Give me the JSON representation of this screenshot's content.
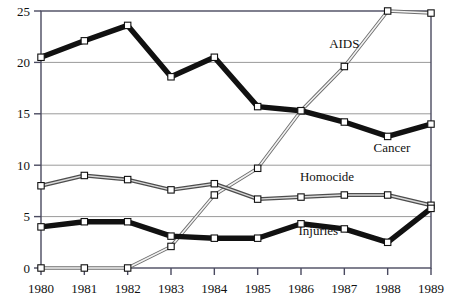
{
  "chart_data": {
    "type": "line",
    "title": "",
    "subtitle": "",
    "xlabel": "",
    "ylabel": "",
    "categories": [
      "1980",
      "1981",
      "1982",
      "1983",
      "1984",
      "1985",
      "1986",
      "1987",
      "1988",
      "1989"
    ],
    "x": [
      1980,
      1981,
      1982,
      1983,
      1984,
      1985,
      1986,
      1987,
      1988,
      1989
    ],
    "xlim": [
      1980,
      1989
    ],
    "ylim": [
      0,
      25
    ],
    "y_ticks": [
      0,
      5,
      10,
      15,
      20,
      25
    ],
    "y_tick_labels": [
      "0",
      "5",
      "10",
      "15",
      "20",
      "25"
    ],
    "grid": "horizontal",
    "legend": "inline-annotations",
    "markers": "open-square",
    "series": [
      {
        "name": "Cancer",
        "label": "Cancer",
        "color": "#111111",
        "style": "thick-black",
        "values": [
          20.5,
          22.1,
          23.6,
          18.6,
          20.5,
          15.7,
          15.3,
          14.2,
          12.8,
          14.0
        ]
      },
      {
        "name": "AIDS",
        "label": "AIDS",
        "color": "#8a8a8a",
        "style": "thin-double-gray",
        "values": [
          0.0,
          0.0,
          0.0,
          2.1,
          7.1,
          9.7,
          15.3,
          19.6,
          25.0,
          24.8
        ]
      },
      {
        "name": "Homocide",
        "label": "Homocide",
        "color": "#5a5a5a",
        "style": "medium-gray",
        "values": [
          8.0,
          9.0,
          8.6,
          7.6,
          8.2,
          6.7,
          6.9,
          7.1,
          7.1,
          6.1
        ]
      },
      {
        "name": "Injuries",
        "label": "Injuries",
        "color": "#111111",
        "style": "thick-black",
        "values": [
          4.0,
          4.5,
          4.5,
          3.1,
          2.9,
          2.9,
          4.3,
          3.8,
          2.5,
          5.8
        ]
      }
    ],
    "annotations": [
      {
        "text": "AIDS",
        "x": 1987.0,
        "y": 21.4
      },
      {
        "text": "Cancer",
        "x": 1988.1,
        "y": 11.3
      },
      {
        "text": "Homocide",
        "x": 1986.6,
        "y": 8.5
      },
      {
        "text": "Injuries",
        "x": 1986.4,
        "y": 3.2
      }
    ],
    "axis_color": "#4a4a60",
    "grid_color": "#9a9a9a",
    "background": "#ffffff"
  }
}
